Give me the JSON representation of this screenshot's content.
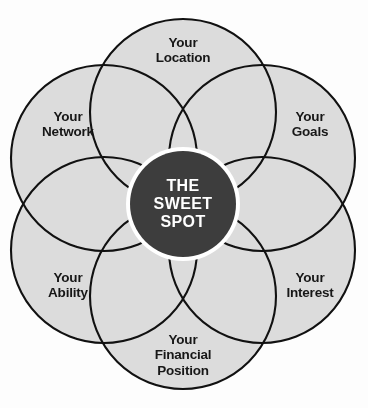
{
  "diagram": {
    "type": "venn-flower",
    "title_center": "THE\nSWEET\nSPOT",
    "center_lines": [
      "THE",
      "SWEET",
      "SPOT"
    ],
    "petal_count": 6,
    "petals": [
      {
        "id": "location",
        "label": "Your\nLocation",
        "lines": [
          "Your",
          "Location"
        ],
        "angle_deg": 270,
        "cx": 183,
        "cy": 112,
        "label_x": 183,
        "label_y": 50
      },
      {
        "id": "goals",
        "label": "Your\nGoals",
        "lines": [
          "Your",
          "Goals"
        ],
        "angle_deg": 330,
        "cx": 262,
        "cy": 158,
        "label_x": 310,
        "label_y": 124
      },
      {
        "id": "interest",
        "label": "Your\nInterest",
        "lines": [
          "Your",
          "Interest"
        ],
        "angle_deg": 30,
        "cx": 262,
        "cy": 250,
        "label_x": 310,
        "label_y": 285
      },
      {
        "id": "financial",
        "label": "Your\nFinancial\nPosition",
        "lines": [
          "Your",
          "Financial",
          "Position"
        ],
        "angle_deg": 90,
        "cx": 183,
        "cy": 296,
        "label_x": 183,
        "label_y": 355
      },
      {
        "id": "ability",
        "label": "Your\nAbility",
        "lines": [
          "Your",
          "Ability"
        ],
        "angle_deg": 150,
        "cx": 104,
        "cy": 250,
        "label_x": 68,
        "label_y": 285
      },
      {
        "id": "network",
        "label": "Your\nNetwork",
        "lines": [
          "Your",
          "Network"
        ],
        "angle_deg": 210,
        "cx": 104,
        "cy": 158,
        "label_x": 68,
        "label_y": 124
      }
    ],
    "geometry": {
      "center_x": 183,
      "center_y": 204,
      "petal_radius": 93,
      "petal_offset": 93,
      "hub_radius": 53,
      "hub_ring_radius": 57
    },
    "colors": {
      "background": "#fdfdfd",
      "petal_fill": "#dcdcdc",
      "petal_stroke": "#111111",
      "hub_fill": "#3d3d3d",
      "hub_ring": "#ffffff",
      "label_text": "#171717",
      "hub_text": "#ffffff"
    },
    "stroke_width": 2.1
  }
}
